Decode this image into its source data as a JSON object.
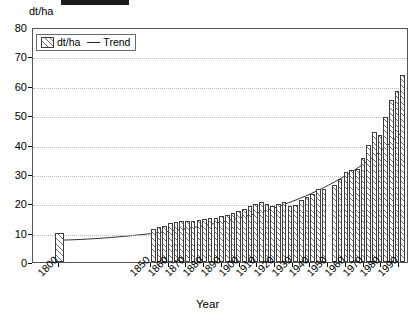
{
  "figure": {
    "y_axis_title": "dt/ha",
    "x_axis_title": "Year"
  },
  "legend": {
    "position": "top-left-inside",
    "entries": [
      {
        "label": "dt/ha",
        "marker": "hatched-bar-swatch"
      },
      {
        "label": "Trend",
        "marker": "line"
      }
    ]
  },
  "chart_data": {
    "type": "bar",
    "title": "",
    "subtitle": "",
    "xlabel": "Year",
    "ylabel": "dt/ha",
    "ylim": [
      0,
      80
    ],
    "ytick_labels": [
      "0",
      "10",
      "20",
      "30",
      "40",
      "50",
      "60",
      "70",
      "80"
    ],
    "yticks": [
      0,
      10,
      20,
      30,
      40,
      50,
      60,
      70,
      80
    ],
    "grid": "horizontal-dotted",
    "xtick_labels": [
      "1800",
      "1850",
      "1860",
      "1870",
      "1880",
      "1890",
      "1900",
      "1910",
      "1920",
      "1930",
      "1940",
      "1950",
      "1960",
      "1970",
      "1980",
      "1990"
    ],
    "xticks": [
      1800,
      1850,
      1860,
      1870,
      1880,
      1890,
      1900,
      1910,
      1920,
      1930,
      1940,
      1950,
      1960,
      1970,
      1980,
      1990
    ],
    "annotations": [
      "gap in bar series around 1945 (no data)"
    ],
    "series": [
      {
        "name": "dt/ha",
        "type": "bar",
        "x": [
          1800,
          1850,
          1855,
          1860,
          1865,
          1870,
          1875,
          1880,
          1885,
          1890,
          1895,
          1900,
          1905,
          1910,
          1915,
          1920,
          1925,
          1930,
          1935,
          1940,
          1950,
          1955,
          1960,
          1965,
          1970,
          1975,
          1980,
          1985,
          1990
        ],
        "values": [
          10.0,
          11.5,
          12.0,
          13.5,
          14.0,
          14.0,
          14.5,
          15.0,
          15.5,
          16.5,
          17.5,
          18.5,
          20.0,
          20.5,
          19.0,
          20.5,
          19.0,
          21.5,
          23.0,
          25.0,
          26.5,
          28.5,
          31.0,
          31.5,
          35.5,
          39.5,
          44.0,
          43.5,
          49.0
        ]
      },
      {
        "name": "Trend",
        "type": "line",
        "x": [
          1800,
          1850,
          1870,
          1890,
          1910,
          1930,
          1950,
          1960,
          1970,
          1980,
          1990
        ],
        "values": [
          7.5,
          11.5,
          13.0,
          15.0,
          18.0,
          21.5,
          26.5,
          30.0,
          34.0,
          39.0,
          45.0
        ]
      }
    ],
    "bars_right_block": {
      "note": "tall bars after 1960 reaching maximum",
      "x": [
        1962,
        1965,
        1968,
        1971,
        1974,
        1977,
        1980,
        1983,
        1986,
        1990
      ],
      "values": [
        31.0,
        32.0,
        35.5,
        40.0,
        43.5,
        49.0,
        55.0,
        58.0,
        63.5,
        69.0
      ]
    }
  }
}
